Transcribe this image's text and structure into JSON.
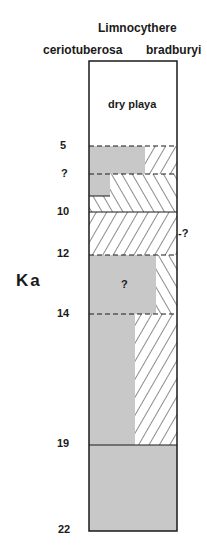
{
  "header": {
    "genus": "Limnocythere",
    "species_left": "ceriotuberosa",
    "species_right": "bradburyi"
  },
  "axis": {
    "label": "Ka",
    "ticks": [
      {
        "label": "5",
        "y": 146
      },
      {
        "label": "?",
        "y": 174
      },
      {
        "label": "10",
        "y": 212
      },
      {
        "label": "12",
        "y": 255
      },
      {
        "label": "14",
        "y": 314
      },
      {
        "label": "19",
        "y": 445
      },
      {
        "label": "22",
        "y": 531
      }
    ]
  },
  "column": {
    "top_label": "dry playa",
    "uncertain_mark_middle": "?",
    "uncertain_mark_right": "-?"
  },
  "legend_colors": {
    "ceriotuberosa_fill": "#c8c8c8",
    "bradburyi_hatch": "#1a1a1a",
    "outline": "#1a1a1a"
  },
  "intervals": [
    {
      "from": "0",
      "to": "5",
      "content": "dry playa"
    },
    {
      "from": "5",
      "to": "?",
      "ceriotuberosa": "left ~63%",
      "bradburyi": "right, / hatch"
    },
    {
      "from": "?",
      "to": "10",
      "ceriotuberosa": "small left block",
      "bradburyi": "\\ hatch"
    },
    {
      "from": "10",
      "to": "12",
      "ceriotuberosa": "none",
      "bradburyi": "full, / hatch"
    },
    {
      "from": "12",
      "to": "14",
      "ceriotuberosa": "left ~75% (uncertain ?)",
      "bradburyi": "right, \\ hatch"
    },
    {
      "from": "14",
      "to": "19",
      "ceriotuberosa": "left ~52%",
      "bradburyi": "right, / hatch"
    },
    {
      "from": "19",
      "to": "22",
      "ceriotuberosa": "full",
      "bradburyi": "none"
    }
  ]
}
